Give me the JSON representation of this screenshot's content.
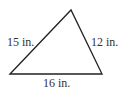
{
  "diagram": {
    "shape": "triangle",
    "stroke_color": "#222222",
    "vertices": [
      [
        10,
        74
      ],
      [
        71,
        10
      ],
      [
        102,
        74
      ]
    ],
    "sides": {
      "left": {
        "label": "15 in.",
        "length": 15,
        "unit": "in."
      },
      "right": {
        "label": "12 in.",
        "length": 12,
        "unit": "in."
      },
      "bottom": {
        "label": "16 in.",
        "length": 16,
        "unit": "in."
      }
    }
  }
}
